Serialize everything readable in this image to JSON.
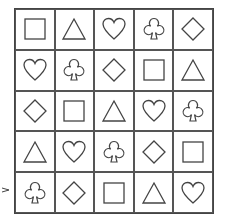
{
  "grid": {
    "rows": 5,
    "cols": 5,
    "cells": [
      [
        "square",
        "triangle",
        "heart",
        "club",
        "diamond"
      ],
      [
        "heart",
        "club",
        "diamond",
        "square",
        "triangle"
      ],
      [
        "diamond",
        "square",
        "triangle",
        "heart",
        "club"
      ],
      [
        "triangle",
        "heart",
        "club",
        "diamond",
        "square"
      ],
      [
        "club",
        "diamond",
        "square",
        "triangle",
        "heart"
      ]
    ]
  },
  "pointer": {
    "row": 4,
    "icon": "arrow-right-icon"
  },
  "colors": {
    "stroke": "#444444",
    "background": "#ffffff"
  }
}
